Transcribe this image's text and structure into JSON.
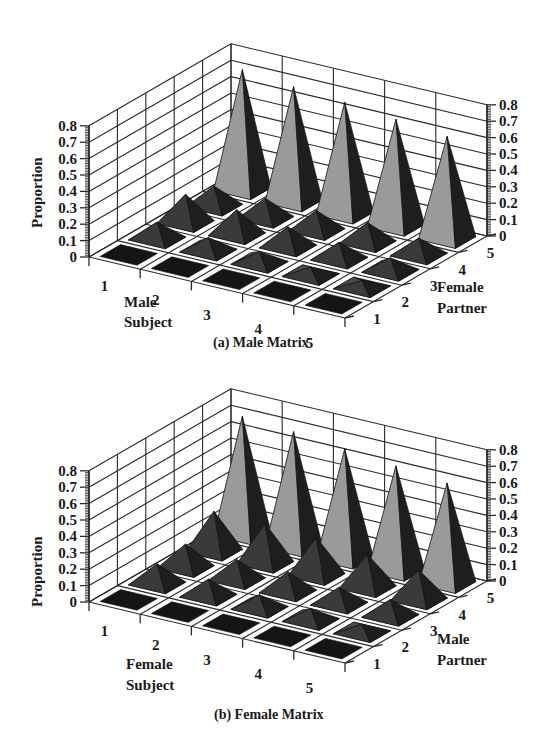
{
  "chart_data": [
    {
      "type": "bar3d",
      "panel": "a",
      "caption": "(a) Male Matrix",
      "zlabel": "Proportion",
      "xlabel": "Male Subject",
      "ylabel": "Female Partner",
      "x_ticks": [
        "1",
        "2",
        "3",
        "4",
        "5"
      ],
      "y_ticks": [
        "1",
        "2",
        "3",
        "4",
        "5"
      ],
      "z_ticks": [
        "0",
        "0.1",
        "0.2",
        "0.3",
        "0.4",
        "0.5",
        "0.6",
        "0.7",
        "0.8"
      ],
      "zlim": [
        0,
        0.8
      ],
      "grid": true,
      "note": "values[i][j] = proportion for subject i+1 (rows) and partner j+1 (cols); estimated from pyramid heights",
      "values": [
        [
          0.02,
          0.1,
          0.17,
          0.12,
          0.73
        ],
        [
          0.02,
          0.08,
          0.15,
          0.12,
          0.7
        ],
        [
          0.02,
          0.07,
          0.12,
          0.12,
          0.68
        ],
        [
          0.02,
          0.05,
          0.1,
          0.12,
          0.65
        ],
        [
          0.02,
          0.04,
          0.08,
          0.1,
          0.62
        ]
      ]
    },
    {
      "type": "bar3d",
      "panel": "b",
      "caption": "(b) Female Matrix",
      "zlabel": "Proportion",
      "xlabel": "Female Subject",
      "ylabel": "Male Partner",
      "x_ticks": [
        "1",
        "2",
        "3",
        "4",
        "5"
      ],
      "y_ticks": [
        "1",
        "2",
        "3",
        "4",
        "5"
      ],
      "z_ticks": [
        "0",
        "0.1",
        "0.2",
        "0.3",
        "0.4",
        "0.5",
        "0.6",
        "0.7",
        "0.8"
      ],
      "zlim": [
        0,
        0.8
      ],
      "grid": true,
      "note": "values[i][j] = proportion for subject i+1 (rows) and partner j+1 (cols); estimated from pyramid heights",
      "values": [
        [
          0.02,
          0.12,
          0.14,
          0.24,
          0.72
        ],
        [
          0.02,
          0.1,
          0.12,
          0.24,
          0.7
        ],
        [
          0.02,
          0.08,
          0.12,
          0.23,
          0.67
        ],
        [
          0.02,
          0.07,
          0.1,
          0.2,
          0.64
        ],
        [
          0.02,
          0.05,
          0.1,
          0.18,
          0.61
        ]
      ]
    }
  ],
  "panels": {
    "a": {
      "caption": "(a) Male Matrix",
      "zlabel": "Proportion",
      "subject_line1": "Male",
      "subject_line2": "Subject",
      "partner_line1": "Female",
      "partner_line2": "Partner"
    },
    "b": {
      "caption": "(b) Female Matrix",
      "zlabel": "Proportion",
      "subject_line1": "Female",
      "subject_line2": "Subject",
      "partner_line1": "Male",
      "partner_line2": "Partner"
    }
  },
  "colors": {
    "grid": "#2a2a2a",
    "face_light": "#b4b4b4",
    "face_mid": "#8a8a8a",
    "face_dark": "#1e1e1e",
    "base_dark": "#151515"
  }
}
